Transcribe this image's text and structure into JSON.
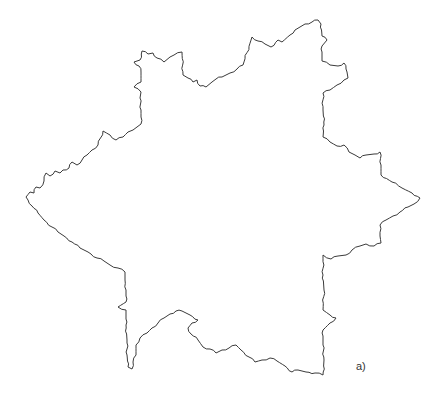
{
  "figure": {
    "label": "a)",
    "stroke_color": "#3a3a3a",
    "background": "#ffffff",
    "outline": {
      "description": "Closed fractal six-pointed star-like outline with jagged edges",
      "points": [
        [
          26,
          197
        ],
        [
          30,
          192
        ],
        [
          34,
          193
        ],
        [
          36,
          187
        ],
        [
          40,
          188
        ],
        [
          44,
          181
        ],
        [
          46,
          173
        ],
        [
          50,
          176
        ],
        [
          55,
          171
        ],
        [
          60,
          173
        ],
        [
          63,
          170
        ],
        [
          69,
          168
        ],
        [
          72,
          162
        ],
        [
          77,
          165
        ],
        [
          82,
          160
        ],
        [
          87,
          155
        ],
        [
          92,
          150
        ],
        [
          98,
          145
        ],
        [
          103,
          131
        ],
        [
          110,
          135
        ],
        [
          116,
          140
        ],
        [
          123,
          137
        ],
        [
          128,
          132
        ],
        [
          133,
          130
        ],
        [
          137,
          127
        ],
        [
          141,
          124
        ],
        [
          141,
          110
        ],
        [
          140,
          98
        ],
        [
          141,
          92
        ],
        [
          134,
          87
        ],
        [
          141,
          82
        ],
        [
          141,
          72
        ],
        [
          139,
          66
        ],
        [
          134,
          62
        ],
        [
          140,
          60
        ],
        [
          142,
          51
        ],
        [
          148,
          54
        ],
        [
          153,
          53
        ],
        [
          157,
          58
        ],
        [
          164,
          62
        ],
        [
          170,
          57
        ],
        [
          174,
          55
        ],
        [
          182,
          52
        ],
        [
          183,
          75
        ],
        [
          188,
          78
        ],
        [
          193,
          82
        ],
        [
          197,
          80
        ],
        [
          200,
          86
        ],
        [
          206,
          87
        ],
        [
          212,
          82
        ],
        [
          216,
          79
        ],
        [
          222,
          77
        ],
        [
          230,
          73
        ],
        [
          237,
          69
        ],
        [
          243,
          65
        ],
        [
          252,
          37
        ],
        [
          258,
          41
        ],
        [
          265,
          44
        ],
        [
          271,
          47
        ],
        [
          278,
          40
        ],
        [
          282,
          42
        ],
        [
          290,
          35
        ],
        [
          295,
          30
        ],
        [
          300,
          27
        ],
        [
          305,
          24
        ],
        [
          312,
          22
        ],
        [
          318,
          20
        ],
        [
          321,
          24
        ],
        [
          322,
          36
        ],
        [
          327,
          40
        ],
        [
          322,
          46
        ],
        [
          322,
          61
        ],
        [
          330,
          65
        ],
        [
          338,
          66
        ],
        [
          344,
          63
        ],
        [
          347,
          72
        ],
        [
          348,
          78
        ],
        [
          344,
          80
        ],
        [
          337,
          85
        ],
        [
          330,
          90
        ],
        [
          323,
          93
        ],
        [
          323,
          110
        ],
        [
          324,
          125
        ],
        [
          323,
          137
        ],
        [
          330,
          142
        ],
        [
          337,
          146
        ],
        [
          344,
          145
        ],
        [
          349,
          152
        ],
        [
          355,
          155
        ],
        [
          360,
          158
        ],
        [
          366,
          155
        ],
        [
          374,
          154
        ],
        [
          380,
          152
        ],
        [
          381,
          165
        ],
        [
          381,
          175
        ],
        [
          392,
          182
        ],
        [
          402,
          188
        ],
        [
          412,
          193
        ],
        [
          420,
          198
        ],
        [
          414,
          204
        ],
        [
          408,
          207
        ],
        [
          400,
          212
        ],
        [
          393,
          216
        ],
        [
          386,
          220
        ],
        [
          380,
          225
        ],
        [
          380,
          236
        ],
        [
          381,
          243
        ],
        [
          374,
          246
        ],
        [
          366,
          244
        ],
        [
          360,
          246
        ],
        [
          352,
          250
        ],
        [
          346,
          255
        ],
        [
          338,
          256
        ],
        [
          331,
          259
        ],
        [
          323,
          255
        ],
        [
          323,
          275
        ],
        [
          324,
          290
        ],
        [
          323,
          310
        ],
        [
          330,
          315
        ],
        [
          336,
          318
        ],
        [
          330,
          323
        ],
        [
          323,
          330
        ],
        [
          323,
          345
        ],
        [
          324,
          360
        ],
        [
          323,
          375
        ],
        [
          315,
          373
        ],
        [
          306,
          372
        ],
        [
          298,
          370
        ],
        [
          292,
          372
        ],
        [
          285,
          366
        ],
        [
          277,
          361
        ],
        [
          270,
          358
        ],
        [
          262,
          360
        ],
        [
          255,
          362
        ],
        [
          249,
          357
        ],
        [
          241,
          350
        ],
        [
          236,
          345
        ],
        [
          229,
          348
        ],
        [
          222,
          350
        ],
        [
          216,
          353
        ],
        [
          210,
          349
        ],
        [
          203,
          347
        ],
        [
          198,
          340
        ],
        [
          191,
          334
        ],
        [
          188,
          328
        ],
        [
          192,
          323
        ],
        [
          198,
          320
        ],
        [
          190,
          315
        ],
        [
          182,
          311
        ],
        [
          176,
          311
        ],
        [
          170,
          314
        ],
        [
          164,
          318
        ],
        [
          158,
          323
        ],
        [
          152,
          328
        ],
        [
          147,
          333
        ],
        [
          140,
          338
        ],
        [
          136,
          345
        ],
        [
          136,
          355
        ],
        [
          133,
          362
        ],
        [
          132,
          369
        ],
        [
          128,
          367
        ],
        [
          127,
          355
        ],
        [
          127,
          340
        ],
        [
          126,
          325
        ],
        [
          126,
          310
        ],
        [
          118,
          307
        ],
        [
          126,
          302
        ],
        [
          126,
          290
        ],
        [
          125,
          280
        ],
        [
          125,
          272
        ],
        [
          118,
          268
        ],
        [
          110,
          265
        ],
        [
          104,
          261
        ],
        [
          97,
          258
        ],
        [
          88,
          252
        ],
        [
          80,
          248
        ],
        [
          72,
          242
        ],
        [
          64,
          236
        ],
        [
          58,
          232
        ],
        [
          52,
          227
        ],
        [
          44,
          220
        ],
        [
          38,
          213
        ],
        [
          32,
          206
        ],
        [
          26,
          197
        ]
      ]
    }
  }
}
